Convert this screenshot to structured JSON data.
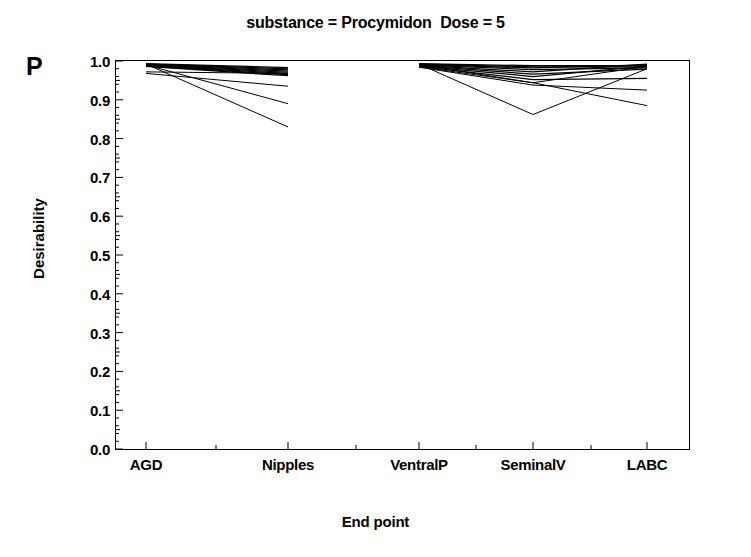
{
  "figure": {
    "title": "substance = Procymidon  Dose = 5",
    "panel_letter": "P",
    "x_axis_title": "End point",
    "y_axis_title": "Desirability"
  },
  "axes": {
    "y_tick_labels": [
      "1.0",
      "0.9",
      "0.8",
      "0.7",
      "0.6",
      "0.5",
      "0.4",
      "0.3",
      "0.2",
      "0.1",
      "0.0"
    ],
    "x_tick_labels": [
      "AGD",
      "Nipples",
      "VentralP",
      "SeminalV",
      "LABC"
    ]
  },
  "chart_data": {
    "type": "line",
    "title": "substance = Procymidon  Dose = 5",
    "subtitle": "P",
    "xlabel": "End point",
    "ylabel": "Desirability",
    "ylim": [
      0.0,
      1.0
    ],
    "yticks": [
      0.0,
      0.1,
      0.2,
      0.3,
      0.4,
      0.5,
      0.6,
      0.7,
      0.8,
      0.9,
      1.0
    ],
    "ytick_labels": [
      "0.0",
      "0.1",
      "0.2",
      "0.3",
      "0.4",
      "0.5",
      "0.6",
      "0.7",
      "0.8",
      "0.9",
      "1.0"
    ],
    "minor_ticks": true,
    "grid": false,
    "legend": "none",
    "categories": [
      "AGD",
      "Nipples",
      "VentralP",
      "SeminalV",
      "LABC"
    ],
    "segments": [
      {
        "name": "left-panel",
        "categories": [
          "AGD",
          "Nipples"
        ]
      },
      {
        "name": "right-panel",
        "categories": [
          "VentralP",
          "SeminalV",
          "LABC"
        ]
      }
    ],
    "note": "Profile plot drawn as two disconnected panels; no line connects Nipples to VentralP.",
    "series": [
      {
        "name": "line-1",
        "values": [
          0.993,
          0.983,
          0.993,
          0.988,
          0.988
        ]
      },
      {
        "name": "line-2",
        "values": [
          0.992,
          0.98,
          0.992,
          0.985,
          0.985
        ]
      },
      {
        "name": "line-3",
        "values": [
          0.991,
          0.977,
          0.991,
          0.982,
          0.99
        ]
      },
      {
        "name": "line-4",
        "values": [
          0.99,
          0.974,
          0.99,
          0.978,
          0.982
        ]
      },
      {
        "name": "line-5",
        "values": [
          0.989,
          0.971,
          0.989,
          0.972,
          0.992
        ]
      },
      {
        "name": "line-6",
        "values": [
          0.988,
          0.968,
          0.988,
          0.966,
          0.979
        ]
      },
      {
        "name": "line-7",
        "values": [
          0.987,
          0.965,
          0.987,
          0.96,
          0.987
        ]
      },
      {
        "name": "line-8",
        "values": [
          0.986,
          0.962,
          0.986,
          0.952,
          0.955
        ]
      },
      {
        "name": "line-9",
        "values": [
          0.972,
          0.968,
          0.985,
          0.944,
          0.986
        ]
      },
      {
        "name": "line-10",
        "values": [
          0.968,
          0.935,
          0.984,
          0.938,
          0.925
        ]
      },
      {
        "name": "line-11",
        "values": [
          0.99,
          0.89,
          0.99,
          0.944,
          0.885
        ]
      },
      {
        "name": "line-12",
        "values": [
          0.992,
          0.83,
          0.992,
          0.862,
          0.98
        ]
      }
    ]
  }
}
